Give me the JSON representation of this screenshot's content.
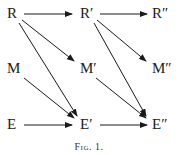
{
  "diagram": {
    "nodes": {
      "R": "R",
      "R1": "R′",
      "R2": "R″",
      "M": "M",
      "M1": "M′",
      "M2": "M″",
      "E": "E",
      "E1": "E′",
      "E2": "E″"
    },
    "edges": [
      [
        "R",
        "R′"
      ],
      [
        "R′",
        "R″"
      ],
      [
        "R",
        "M′"
      ],
      [
        "R",
        "E′"
      ],
      [
        "M",
        "E′"
      ],
      [
        "E",
        "E′"
      ],
      [
        "R′",
        "M″"
      ],
      [
        "R′",
        "E″"
      ],
      [
        "M′",
        "E″"
      ],
      [
        "E′",
        "E″"
      ]
    ],
    "caption": "Fig. 1."
  }
}
